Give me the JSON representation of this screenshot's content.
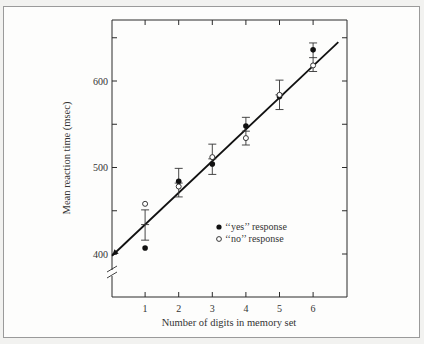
{
  "chart_data": {
    "type": "scatter",
    "title": "",
    "xlabel": "Number of digits in memory set",
    "ylabel": "Mean reaction time (msec)",
    "xlim": [
      0,
      7
    ],
    "ylim": [
      370,
      670
    ],
    "y_axis_break": true,
    "x_ticks": [
      1,
      2,
      3,
      4,
      5,
      6
    ],
    "x_tick_labels": [
      "1",
      "2",
      "3",
      "4",
      "5",
      "6"
    ],
    "y_ticks": [
      400,
      450,
      500,
      550,
      600,
      650
    ],
    "y_tick_labels": [
      "400",
      "",
      "500",
      "",
      "600",
      ""
    ],
    "grid": false,
    "legend": {
      "placement": "center-right",
      "entries": [
        {
          "label": "‘‘yes’’ response",
          "marker": "filled-circle"
        },
        {
          "label": "‘‘no’’ response",
          "marker": "open-circle"
        }
      ]
    },
    "series": [
      {
        "name": "‘‘yes’’ response",
        "marker": "filled-circle",
        "x": [
          1,
          2,
          3,
          4,
          5,
          6
        ],
        "y": [
          407,
          484,
          504,
          548,
          582,
          636
        ]
      },
      {
        "name": "‘‘no’’ response",
        "marker": "open-circle",
        "x": [
          1,
          2,
          3,
          4,
          5,
          6
        ],
        "y": [
          458,
          478,
          512,
          534,
          584,
          618
        ]
      }
    ],
    "error_bars": {
      "x": [
        1,
        2,
        3,
        4,
        5,
        6
      ],
      "mean": [
        434,
        482,
        510,
        542,
        584,
        627
      ],
      "low": [
        416,
        466,
        492,
        526,
        567,
        611
      ],
      "high": [
        451,
        499,
        527,
        558,
        601,
        644
      ]
    },
    "fit_line": {
      "x0": 0,
      "y0": 398,
      "x1": 6.75,
      "y1": 645,
      "arrow_at_start": true
    }
  }
}
